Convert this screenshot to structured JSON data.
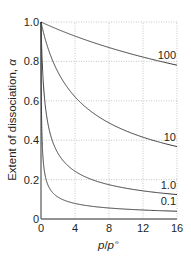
{
  "chart_data": {
    "type": "line",
    "title": "",
    "xlabel": "p/p°",
    "ylabel": "Extent of dissociation, α",
    "xlim": [
      0,
      16
    ],
    "ylim": [
      0,
      1.0
    ],
    "grid": true,
    "legend_position": "inline-right",
    "x_ticks": [
      "0",
      "4",
      "8",
      "12",
      "16"
    ],
    "y_ticks": [
      "0",
      "0.2",
      "0.4",
      "0.6",
      "0.8",
      "1.0"
    ],
    "x": [
      0,
      0.1,
      0.25,
      0.5,
      1,
      2,
      3,
      4,
      6,
      8,
      10,
      12,
      14,
      16
    ],
    "series": [
      {
        "name": "100",
        "values": [
          1.0,
          0.998,
          0.995,
          0.99,
          0.981,
          0.962,
          0.945,
          0.928,
          0.898,
          0.87,
          0.845,
          0.822,
          0.801,
          0.781
        ]
      },
      {
        "name": "10",
        "values": [
          1.0,
          0.981,
          0.953,
          0.913,
          0.845,
          0.745,
          0.674,
          0.62,
          0.542,
          0.488,
          0.447,
          0.415,
          0.389,
          0.368
        ]
      },
      {
        "name": "1.0",
        "values": [
          1.0,
          0.845,
          0.707,
          0.577,
          0.447,
          0.333,
          0.277,
          0.243,
          0.2,
          0.174,
          0.156,
          0.143,
          0.133,
          0.124
        ]
      },
      {
        "name": "0.1",
        "values": [
          1.0,
          0.447,
          0.302,
          0.218,
          0.156,
          0.111,
          0.091,
          0.079,
          0.064,
          0.056,
          0.05,
          0.046,
          0.042,
          0.04
        ]
      }
    ],
    "annotations": [
      "100",
      "10",
      "1.0",
      "0.1"
    ]
  },
  "labels": {
    "ylabel_text": "Extent of dissociation, ",
    "ylabel_symbol": "α",
    "xlabel_p": "p",
    "xlabel_slash": "/",
    "xlabel_p0": "p",
    "xlabel_sup": "⦵"
  }
}
